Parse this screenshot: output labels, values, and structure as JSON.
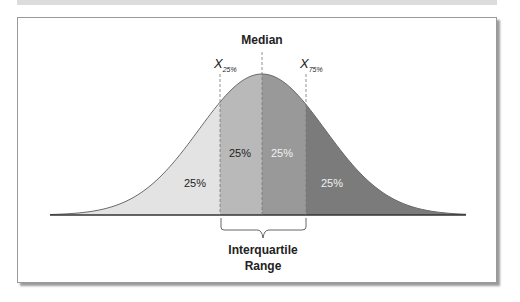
{
  "diagram": {
    "title": "Median",
    "q1_label": {
      "main": "X",
      "sub": "25%"
    },
    "q3_label": {
      "main": "X",
      "sub": "75%"
    },
    "bracket_label": [
      "Interquartile",
      "Range"
    ],
    "regions": [
      {
        "name": "lower-quartile",
        "label": "25%",
        "fill": "#e3e3e3",
        "text_color": "#222222"
      },
      {
        "name": "second-quartile",
        "label": "25%",
        "fill": "#b9b9b9",
        "text_color": "#222222"
      },
      {
        "name": "third-quartile",
        "label": "25%",
        "fill": "#999999",
        "text_color": "#f2f2f2"
      },
      {
        "name": "upper-quartile",
        "label": "25%",
        "fill": "#7b7b7b",
        "text_color": "#f2f2f2"
      }
    ]
  },
  "chart_data": {
    "type": "area",
    "title": "Median",
    "x_markers": [
      {
        "label": "X25%",
        "position": "Q1"
      },
      {
        "label": "Median",
        "position": "Q2"
      },
      {
        "label": "X75%",
        "position": "Q3"
      }
    ],
    "categories": [
      "Below Q1",
      "Q1 to Median",
      "Median to Q3",
      "Above Q3"
    ],
    "values": [
      25,
      25,
      25,
      25
    ],
    "value_unit": "%",
    "annotations": [
      "Interquartile Range (Q1 to Q3)"
    ],
    "xlabel": "",
    "ylabel": "",
    "grid": false,
    "legend": "none"
  }
}
